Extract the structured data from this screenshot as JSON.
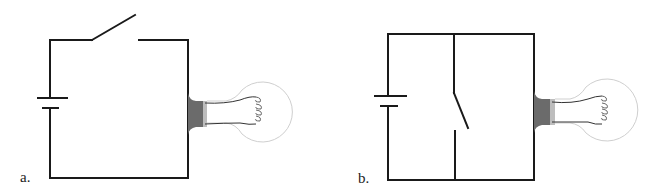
{
  "figure": {
    "panels": [
      {
        "id": "a",
        "label": "a.",
        "description": "Series circuit: battery, open switch on top wire, light bulb on right side",
        "components": [
          "battery",
          "switch-open-series",
          "light-bulb"
        ]
      },
      {
        "id": "b",
        "label": "b.",
        "description": "Circuit with battery, light bulb, and open switch on a branch wire parallel to the bulb",
        "components": [
          "battery",
          "switch-open-parallel",
          "light-bulb"
        ]
      }
    ],
    "colors": {
      "wire": "#1a1a1a",
      "bulb_base": "#6b6b6b",
      "bulb_glass": "#cfcfcf",
      "background": "#ffffff"
    }
  }
}
